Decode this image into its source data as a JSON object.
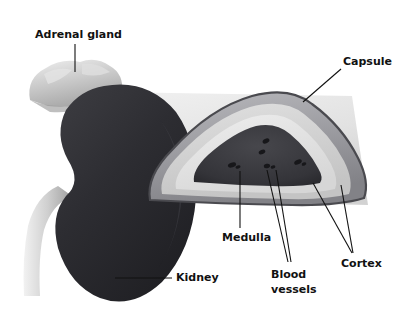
{
  "figure": {
    "background_color": "#ffffff",
    "width": 400,
    "height": 321,
    "style": "grayscale anatomical illustration, whole kidney at left with adrenal gland and ureter, cut cross-section at right"
  },
  "labels": [
    {
      "id": "adrenal-gland",
      "text": "Adrenal gland",
      "x": 35,
      "y": 28,
      "leader": {
        "type": "line",
        "x1": 75,
        "y1": 44,
        "x2": 75,
        "y2": 72
      },
      "points_to": "light grey lobulated cap sitting on top of the kidney"
    },
    {
      "id": "capsule",
      "text": "Capsule",
      "x": 343,
      "y": 55,
      "leader": {
        "type": "line",
        "x1": 341,
        "y1": 69,
        "x2": 303,
        "y2": 102
      },
      "points_to": "thin dark outer rim of the sectioned kidney"
    },
    {
      "id": "kidney",
      "text": "Kidney",
      "x": 176,
      "y": 272,
      "leader": {
        "type": "line",
        "x1": 172,
        "y1": 278,
        "x2": 115,
        "y2": 278
      },
      "points_to": "large dark bean-shaped organ on the left"
    },
    {
      "id": "medulla",
      "text": "Medulla",
      "x": 222,
      "y": 231,
      "leader": {
        "type": "line",
        "x1": 240,
        "y1": 228,
        "x2": 240,
        "y2": 171
      },
      "points_to": "dark triangular inner region of the cross-section"
    },
    {
      "id": "blood-vessels",
      "text": "Blood vessels",
      "line1": "Blood",
      "line2": "vessels",
      "x": 271,
      "y": 268,
      "leaders": [
        {
          "type": "line",
          "x1": 288,
          "y1": 262,
          "x2": 267,
          "y2": 170
        },
        {
          "type": "line",
          "x1": 290,
          "y1": 262,
          "x2": 275,
          "y2": 170
        }
      ],
      "points_to": "small dark oval openings inside the medulla"
    },
    {
      "id": "cortex",
      "text": "Cortex",
      "x": 341,
      "y": 258,
      "leaders": [
        {
          "type": "line",
          "x1": 352,
          "y1": 253,
          "x2": 313,
          "y2": 183
        },
        {
          "type": "line",
          "x1": 353,
          "y1": 253,
          "x2": 341,
          "y2": 185
        }
      ],
      "points_to": "pale grey band between capsule and medulla"
    }
  ],
  "anatomy": {
    "parts": [
      {
        "name": "Adrenal gland",
        "tone": "light grey",
        "hex": "#c9c9c9"
      },
      {
        "name": "Kidney body",
        "tone": "very dark grey",
        "hex": "#2f2f33"
      },
      {
        "name": "Ureter",
        "tone": "light grey",
        "hex": "#cdcdcd"
      },
      {
        "name": "Cut plane",
        "tone": "pale grey wedge",
        "hex": "#e6e6e6"
      },
      {
        "name": "Capsule",
        "tone": "dark outline",
        "hex": "#4a4a4f"
      },
      {
        "name": "Cortex",
        "tone": "pale grey",
        "hex": "#d5d5d5"
      },
      {
        "name": "Medulla",
        "tone": "dark grey",
        "hex": "#3a3a3f"
      },
      {
        "name": "Blood vessels",
        "tone": "near black ovals",
        "hex": "#1b1b1e"
      }
    ]
  }
}
